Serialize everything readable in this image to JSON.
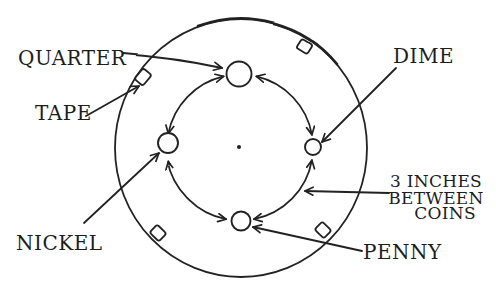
{
  "diagram": {
    "coins": [
      {
        "id": "quarter",
        "label": "QUARTER"
      },
      {
        "id": "dime",
        "label": "DIME"
      },
      {
        "id": "nickel",
        "label": "NICKEL"
      },
      {
        "id": "penny",
        "label": "PENNY"
      }
    ],
    "tape_label": "TAPE",
    "annotation": {
      "line1": "3 INCHES",
      "line2": "BETWEEN",
      "line3": "COINS"
    },
    "colors": {
      "ink": "#222222",
      "paper": "#ffffff"
    }
  }
}
